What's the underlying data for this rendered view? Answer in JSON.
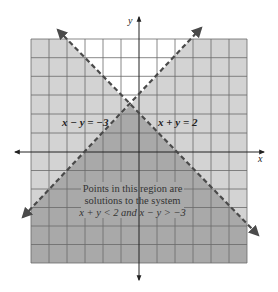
{
  "figure": {
    "axes": {
      "x_label": "x",
      "y_label": "y",
      "grid": {
        "x_min": -6,
        "x_max": 6,
        "y_min": -6,
        "y_max": 6,
        "step": 1
      }
    },
    "lines": [
      {
        "id": "line1",
        "equation": "x − y = −3",
        "style": "dashed",
        "slope": 1,
        "intercept": 3
      },
      {
        "id": "line2",
        "equation": "x + y = 2",
        "style": "dashed",
        "slope": -1,
        "intercept": 2
      }
    ],
    "regions": {
      "solution_color": "#a9a9a9",
      "other_color": "#d3d3d3",
      "unshaded_color": "#ffffff"
    },
    "annotation": {
      "line1": "Points in this region are",
      "line2": "solutions to the system",
      "line3": "x + y < 2 and x − y > −3"
    },
    "intersection": {
      "x": -0.5,
      "y": 2.5
    }
  }
}
